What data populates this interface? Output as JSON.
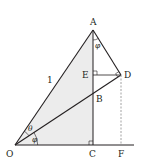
{
  "figure": {
    "type": "geometry",
    "colors": {
      "stroke": "#231f20",
      "shade": "#ececec",
      "dashed": "#8a8a8a",
      "background": "#ffffff"
    },
    "points": {
      "O": {
        "label": "O",
        "x": 15,
        "y": 145
      },
      "A": {
        "label": "A",
        "x": 93,
        "y": 30
      },
      "B": {
        "label": "B",
        "x": 93,
        "y": 96
      },
      "C": {
        "label": "C",
        "x": 93,
        "y": 145
      },
      "D": {
        "label": "D",
        "x": 121,
        "y": 75
      },
      "E": {
        "label": "E",
        "x": 93,
        "y": 75
      },
      "F": {
        "label": "F",
        "x": 121,
        "y": 145
      }
    },
    "labels": {
      "O": "O",
      "A": "A",
      "B": "B",
      "C": "C",
      "D": "D",
      "E": "E",
      "F": "F",
      "side_OA": "1",
      "angle_theta": "θ",
      "angle_phi_O": "φ",
      "angle_phi_A": "φ"
    },
    "segments": [
      [
        "O",
        "A"
      ],
      [
        "O",
        "D"
      ],
      [
        "A",
        "D"
      ],
      [
        "A",
        "C"
      ],
      [
        "E",
        "D"
      ],
      [
        "O",
        "F+"
      ]
    ],
    "dashed_segments": [
      [
        "D",
        "F"
      ]
    ],
    "right_angles": [
      "E",
      "C",
      "D"
    ]
  }
}
